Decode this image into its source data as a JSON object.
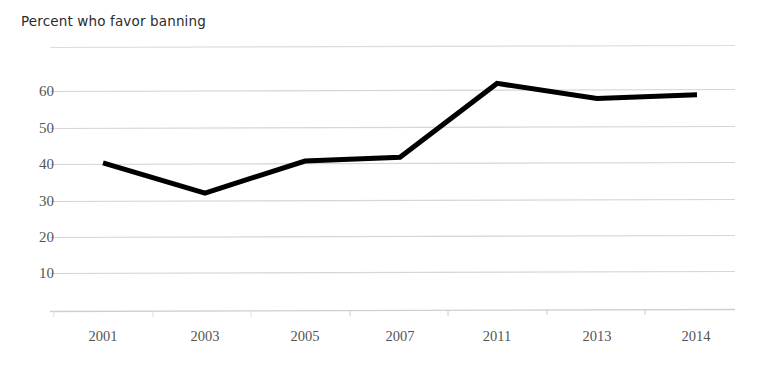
{
  "chart_data": {
    "type": "line",
    "title": "Percent who favor banning",
    "xlabel": "",
    "ylabel": "",
    "categories": [
      "2001",
      "2003",
      "2005",
      "2007",
      "2011",
      "2013",
      "2014"
    ],
    "values": [
      39,
      31,
      39.5,
      40.5,
      60,
      56,
      57
    ],
    "series": [
      {
        "name": "Percent who favor banning",
        "values": [
          39,
          31,
          39.5,
          40.5,
          60,
          56,
          57
        ],
        "color": "#000000"
      }
    ],
    "ylim": [
      0,
      70
    ],
    "y_ticks": [
      10,
      20,
      30,
      40,
      50,
      60
    ],
    "y_tick_labels": [
      "10",
      "20",
      "30",
      "40",
      "50",
      "60"
    ],
    "grid": true,
    "grid_color": "#d9d9d9",
    "gridlines_at": [
      0,
      10,
      20,
      30,
      40,
      50,
      60,
      70
    ],
    "legend": "none",
    "line_width": 5,
    "background": "#ffffff"
  }
}
